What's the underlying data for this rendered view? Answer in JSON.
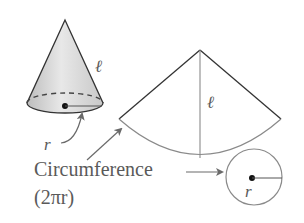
{
  "diagram": {
    "cone": {
      "slant_label": "ℓ",
      "radius_label": "r"
    },
    "sector": {
      "slant_label": "ℓ"
    },
    "circumference": {
      "label": "Circumference",
      "formula": "(2πr)"
    },
    "base_circle": {
      "radius_label": "r"
    },
    "colors": {
      "stroke": "#333333",
      "light_stroke": "#8a8a8a",
      "text": "#5a5a5a",
      "cone_fill": "#dcdcdc"
    }
  }
}
